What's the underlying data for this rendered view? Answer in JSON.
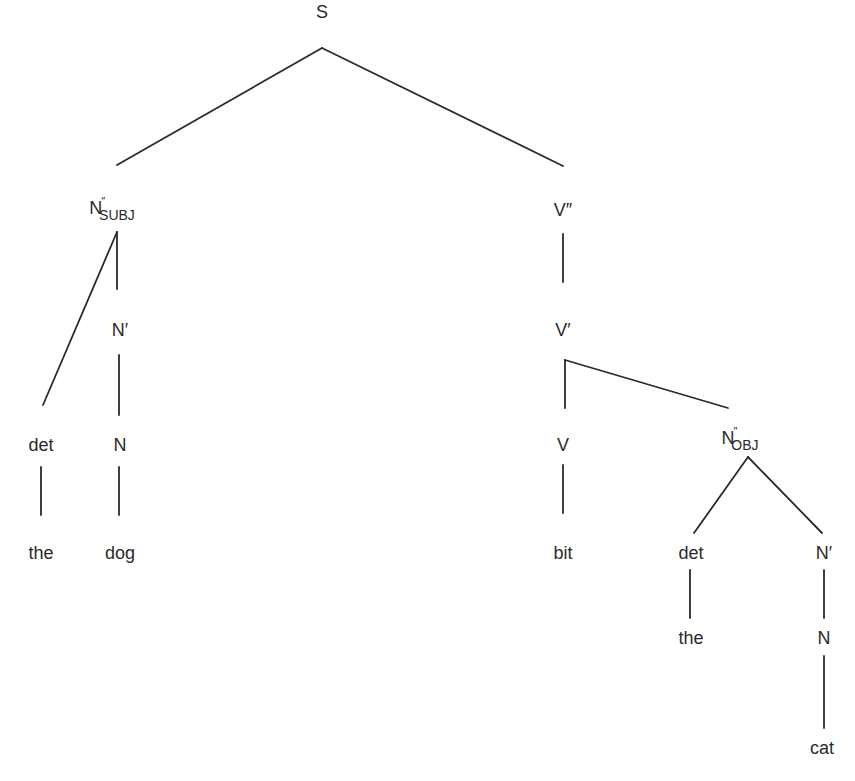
{
  "diagram": {
    "type": "syntax-tree",
    "sentence": "the dog bit the cat",
    "nodes": {
      "s": {
        "label": "S"
      },
      "n2_subj": {
        "label": "N",
        "sup": "″",
        "sub": "SUBJ"
      },
      "n1_subj": {
        "label": "N′"
      },
      "n_subj": {
        "label": "N"
      },
      "det_subj": {
        "label": "det"
      },
      "the_subj": {
        "label": "the"
      },
      "dog": {
        "label": "dog"
      },
      "v2": {
        "label": "V″"
      },
      "v1": {
        "label": "V′"
      },
      "v": {
        "label": "V"
      },
      "bit": {
        "label": "bit"
      },
      "n2_obj": {
        "label": "N",
        "sup": "″",
        "sub": "OBJ"
      },
      "det_obj": {
        "label": "det"
      },
      "the_obj": {
        "label": "the"
      },
      "n1_obj": {
        "label": "N′"
      },
      "n_obj": {
        "label": "N"
      },
      "cat": {
        "label": "cat"
      }
    },
    "edges": [
      [
        "s",
        "n2_subj"
      ],
      [
        "s",
        "v2"
      ],
      [
        "n2_subj",
        "det_subj"
      ],
      [
        "n2_subj",
        "n1_subj"
      ],
      [
        "n1_subj",
        "n_subj"
      ],
      [
        "n_subj",
        "dog"
      ],
      [
        "det_subj",
        "the_subj"
      ],
      [
        "v2",
        "v1"
      ],
      [
        "v1",
        "v"
      ],
      [
        "v1",
        "n2_obj"
      ],
      [
        "v",
        "bit"
      ],
      [
        "n2_obj",
        "det_obj"
      ],
      [
        "n2_obj",
        "n1_obj"
      ],
      [
        "det_obj",
        "the_obj"
      ],
      [
        "n1_obj",
        "n_obj"
      ],
      [
        "n_obj",
        "cat"
      ]
    ]
  }
}
